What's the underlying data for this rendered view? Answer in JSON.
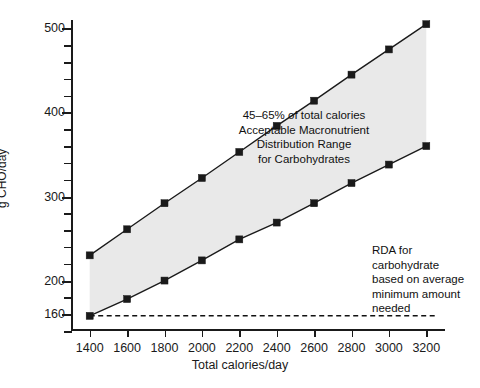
{
  "chart_data": {
    "type": "line",
    "title": "",
    "xlabel": "Total calories/day",
    "ylabel": "g CHO/day",
    "xlim": [
      1300,
      3300
    ],
    "ylim": [
      140,
      510
    ],
    "grid": false,
    "legend": "none",
    "x": [
      1400,
      1600,
      1800,
      2000,
      2200,
      2400,
      2600,
      2800,
      3000,
      3200
    ],
    "xtick_labels": [
      "1400",
      "1600",
      "1800",
      "2000",
      "2200",
      "2400",
      "2600",
      "2800",
      "3000",
      "3200"
    ],
    "ytick_labels": [
      "160",
      "200",
      "300",
      "400",
      "500"
    ],
    "ytick_values": [
      160,
      200,
      300,
      400,
      500
    ],
    "yminor_step": 20,
    "series": [
      {
        "name": "65% of total calories",
        "values": [
          230,
          261,
          292,
          322,
          353,
          384,
          414,
          445,
          475,
          505
        ]
      },
      {
        "name": "45% of total calories",
        "values": [
          158,
          178,
          200,
          224,
          249,
          269,
          292,
          316,
          338,
          360
        ]
      }
    ],
    "band": {
      "name": "Acceptable Macronutrient Distribution Range",
      "fill_color": "#e9e9e9",
      "upper_series": 0,
      "lower_series": 1
    },
    "reference_line": {
      "name": "RDA for carbohydrate",
      "value": 158,
      "style": "dashed",
      "color": "#111111"
    },
    "annotations": [
      {
        "id": "band-annotation",
        "text": "45–65% of total calories\nAcceptable Macronutrient\nDistribution Range\nfor Carbohydrates"
      },
      {
        "id": "rda-annotation",
        "text": "RDA for\ncarbohydrate\nbased on average\nminimum amount\nneeded"
      }
    ]
  },
  "colors": {
    "background": "#ffffff",
    "ink": "#1a1a1a",
    "band_fill": "#e9e9e9"
  }
}
